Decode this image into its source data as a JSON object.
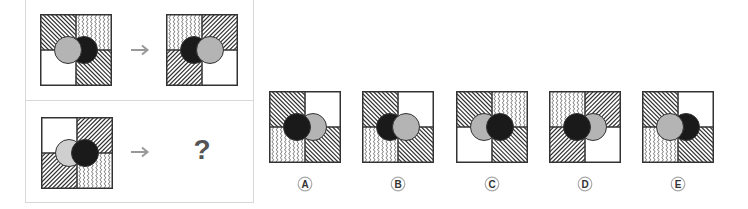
{
  "puzzle": {
    "question_mark": "?",
    "examples": [
      {
        "source": {
          "quadrants": {
            "tl": "hatch-back",
            "tr": "wavy",
            "bl": "white",
            "br": "hatch-back"
          },
          "left_circle": "gray",
          "right_circle": "black",
          "front": "left"
        },
        "target": {
          "quadrants": {
            "tl": "wavy",
            "tr": "hatch-fwd",
            "bl": "hatch-fwd",
            "br": "white"
          },
          "left_circle": "black",
          "right_circle": "gray",
          "front": "right"
        }
      }
    ],
    "query": {
      "quadrants": {
        "tl": "white",
        "tr": "hatch-fwd",
        "bl": "hatch-fwd",
        "br": "wavy"
      },
      "left_circle": "lightgray",
      "right_circle": "black",
      "front": "right"
    }
  },
  "options": [
    {
      "label": "A",
      "quadrants": {
        "tl": "hatch-back",
        "tr": "white",
        "bl": "wavy",
        "br": "hatch-back"
      },
      "left_circle": "black",
      "right_circle": "gray",
      "front": "left"
    },
    {
      "label": "B",
      "quadrants": {
        "tl": "hatch-back",
        "tr": "white",
        "bl": "wavy",
        "br": "hatch-back"
      },
      "left_circle": "black",
      "right_circle": "gray",
      "front": "right"
    },
    {
      "label": "C",
      "quadrants": {
        "tl": "hatch-back",
        "tr": "wavy",
        "bl": "white",
        "br": "hatch-back"
      },
      "left_circle": "gray",
      "right_circle": "black",
      "front": "right"
    },
    {
      "label": "D",
      "quadrants": {
        "tl": "wavy",
        "tr": "hatch-fwd",
        "bl": "hatch-fwd",
        "br": "white"
      },
      "left_circle": "black",
      "right_circle": "gray",
      "front": "left"
    },
    {
      "label": "E",
      "quadrants": {
        "tl": "hatch-back",
        "tr": "white",
        "bl": "wavy",
        "br": "hatch-back"
      },
      "left_circle": "gray",
      "right_circle": "black",
      "front": "left"
    }
  ],
  "colors": {
    "black_circle": "#1a1a1a",
    "gray_circle": "#b4b4b4",
    "lightgray_circle": "#cfcfcf",
    "line": "#333333",
    "arrow": "#999999",
    "border": "#d8d8d8"
  }
}
